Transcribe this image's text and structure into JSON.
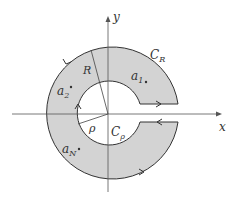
{
  "diagram": {
    "type": "keyhole-contour",
    "colors": {
      "region_fill": "#d3d3d3",
      "stroke": "#333333",
      "axis": "#555555",
      "background": "#ffffff"
    },
    "axes": {
      "x_label": "x",
      "y_label": "y"
    },
    "labels": {
      "outer_contour": "C",
      "outer_contour_sub": "R",
      "inner_contour": "C",
      "inner_contour_sub": "ρ",
      "outer_radius": "R",
      "inner_radius": "ρ"
    },
    "points": [
      {
        "name": "a",
        "sub": "1"
      },
      {
        "name": "a",
        "sub": "2"
      },
      {
        "name": "a",
        "sub": "N"
      }
    ]
  }
}
